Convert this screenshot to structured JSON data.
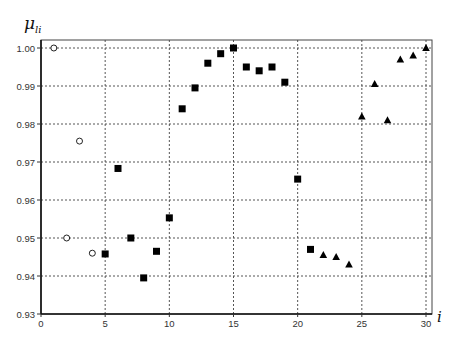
{
  "chart_data": {
    "type": "scatter",
    "title": "",
    "xlabel": "i",
    "ylabel": "μ_li",
    "ylabel_main": "μ",
    "ylabel_sub": "li",
    "xlim": [
      0,
      30.5
    ],
    "ylim": [
      0.93,
      1.003
    ],
    "xticks": [
      0,
      5,
      10,
      15,
      20,
      25,
      30
    ],
    "xtick_labels": [
      "0",
      "5",
      "10",
      "15",
      "20",
      "25",
      "30"
    ],
    "yticks": [
      0.93,
      0.94,
      0.95,
      0.96,
      0.97,
      0.98,
      0.99,
      1.0
    ],
    "ytick_labels": [
      "0.93",
      "0.94",
      "0.95",
      "0.96",
      "0.97",
      "0.98",
      "0.99",
      "1.00"
    ],
    "grid": true,
    "legend": null,
    "series": [
      {
        "name": "open circles",
        "marker": "circle-open",
        "x": [
          1,
          2,
          3,
          4
        ],
        "y": [
          1.0,
          0.95,
          0.9755,
          0.946
        ]
      },
      {
        "name": "filled squares",
        "marker": "square-filled",
        "x": [
          5,
          6,
          7,
          8,
          9,
          10,
          11,
          12,
          13,
          14,
          15,
          16,
          17,
          18,
          19,
          20,
          21
        ],
        "y": [
          0.9458,
          0.9683,
          0.95,
          0.9395,
          0.9465,
          0.9553,
          0.984,
          0.9895,
          0.996,
          0.9985,
          1.0,
          0.995,
          0.994,
          0.995,
          0.991,
          0.9655,
          0.947
        ]
      },
      {
        "name": "filled triangles",
        "marker": "triangle-filled",
        "x": [
          22,
          23,
          24,
          25,
          26,
          27,
          28,
          29,
          30
        ],
        "y": [
          0.9455,
          0.945,
          0.943,
          0.982,
          0.9905,
          0.981,
          0.997,
          0.998,
          1.0
        ]
      }
    ]
  }
}
